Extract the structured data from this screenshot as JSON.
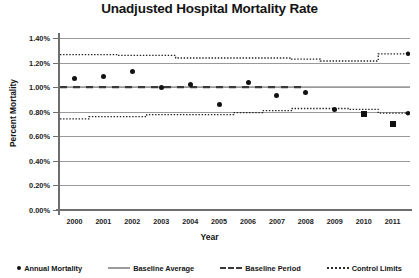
{
  "chart_data": {
    "type": "scatter",
    "title": "Unadjusted Hospital Mortality Rate",
    "xlabel": "Year",
    "ylabel": "Percent Mortality",
    "xlim": [
      1999.5,
      2011.6
    ],
    "ylim": [
      0.0,
      1.4
    ],
    "grid": true,
    "legend_position": "bottom",
    "x": [
      2000,
      2001,
      2002,
      2003,
      2004,
      2005,
      2006,
      2007,
      2008,
      2009,
      2010,
      2011
    ],
    "x_tick_labels": [
      "2000",
      "2001",
      "2002",
      "2003",
      "2004",
      "2005",
      "2006",
      "2007",
      "2008",
      "2009",
      "2010",
      "2011"
    ],
    "y_tick_labels": [
      "0.00%",
      "0.20%",
      "0.40%",
      "0.60%",
      "0.80%",
      "1.00%",
      "1.20%",
      "1.40%"
    ],
    "y_tick_values": [
      0.0,
      0.2,
      0.4,
      0.6,
      0.8,
      1.0,
      1.2,
      1.4
    ],
    "series": [
      {
        "name": "Annual Mortality",
        "marker": "circle",
        "values": [
          1.07,
          1.09,
          1.13,
          1.0,
          1.02,
          0.86,
          1.04,
          0.93,
          0.96,
          0.82,
          0.78,
          0.7
        ],
        "marker_overrides": {
          "2010": "square",
          "2011": "square"
        }
      },
      {
        "name": "Baseline Average",
        "style": "solid",
        "value": 1.0
      },
      {
        "name": "Baseline Period",
        "style": "dashed",
        "value": 1.0,
        "x_start": 2000,
        "x_end": 2008
      },
      {
        "name": "Control Limits",
        "style": "dotted",
        "upper": [
          1.265,
          1.265,
          1.258,
          1.258,
          1.237,
          1.237,
          1.237,
          1.237,
          1.228,
          1.213,
          1.213,
          1.271
        ],
        "lower": [
          0.742,
          0.76,
          0.76,
          0.776,
          0.776,
          0.776,
          0.793,
          0.808,
          0.826,
          0.826,
          0.82,
          0.788
        ]
      }
    ]
  },
  "legend": {
    "items": [
      {
        "label": "Annual Mortality",
        "key": "dot"
      },
      {
        "label": "Baseline Average",
        "key": "solid-line"
      },
      {
        "label": "Baseline Period",
        "key": "dashed-line"
      },
      {
        "label": "Control Limits",
        "key": "dotted-line"
      }
    ]
  }
}
